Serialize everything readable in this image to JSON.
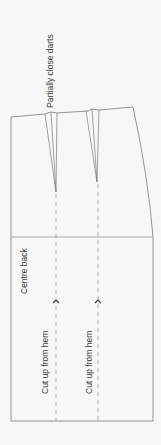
{
  "diagram": {
    "type": "pattern-piece",
    "colors": {
      "background": "#f7f7f7",
      "outline": "#7a7a7a",
      "text": "#3a3a3a",
      "dashed": "#8a8a8a"
    },
    "labels": {
      "darts_note": "Partially close darts",
      "centre_back": "Centre back",
      "cut_line_1": "Cut up from hem",
      "cut_line_2": "Cut up from hem"
    },
    "elements": {
      "darts": [
        {
          "name": "dart-1",
          "center_x": 56,
          "tip_y": 192
        },
        {
          "name": "dart-2",
          "center_x": 97,
          "tip_y": 182
        }
      ],
      "hip_line_y": 237,
      "hem_y": 421,
      "arrows": [
        {
          "name": "cut-arrow-1",
          "x": 56,
          "y": 300,
          "direction": "up"
        },
        {
          "name": "cut-arrow-2",
          "x": 98,
          "y": 300,
          "direction": "up"
        }
      ]
    }
  }
}
